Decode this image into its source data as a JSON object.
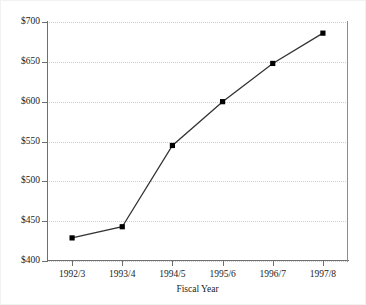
{
  "chart_data": {
    "type": "line",
    "title": "",
    "subtitle": "",
    "xlabel": "Fiscal Year",
    "ylabel": "",
    "categories": [
      "1992/3",
      "1993/4",
      "1994/5",
      "1995/6",
      "1996/7",
      "1997/8"
    ],
    "values": [
      429,
      443,
      545,
      600,
      648,
      686
    ],
    "series": [
      {
        "name": "",
        "values": [
          429,
          443,
          545,
          600,
          648,
          686
        ]
      }
    ],
    "ylim": [
      400,
      700
    ],
    "y_ticks": [
      400,
      450,
      500,
      550,
      600,
      650,
      700
    ],
    "y_tick_labels": [
      "$400",
      "$450",
      "$500",
      "$550",
      "$600",
      "$650",
      "$700"
    ],
    "x_tick_labels": [
      "1992/3",
      "1993/4",
      "1994/5",
      "1995/6",
      "1996/7",
      "1997/8"
    ],
    "value_prefix": "$",
    "grid": true,
    "grid_axis": "y",
    "grid_style": "dotted",
    "legend": false,
    "legend_position": "none",
    "marker": "square",
    "line_color": "#333333",
    "marker_color": "#000000",
    "grid_color": "#cfcfcf",
    "axis_color": "#6f6f6f",
    "text_color": "#1b1b1b",
    "background_color": "#ffffff"
  }
}
